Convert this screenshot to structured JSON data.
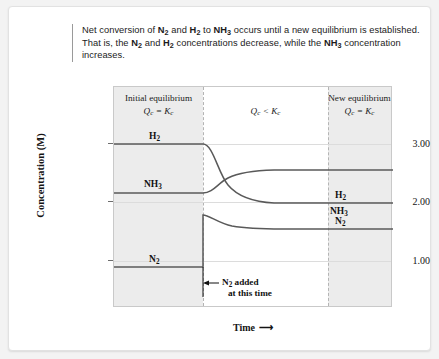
{
  "caption": {
    "segments": [
      {
        "t": "Net conversion of ",
        "b": false
      },
      {
        "t": "N2",
        "b": true
      },
      {
        "t": " and ",
        "b": false
      },
      {
        "t": "H2",
        "b": true
      },
      {
        "t": " to ",
        "b": false
      },
      {
        "t": "NH3",
        "b": true
      },
      {
        "t": " occurs until a new equilibrium is established. That is, the ",
        "b": false
      },
      {
        "t": "N2",
        "b": true
      },
      {
        "t": " and ",
        "b": false
      },
      {
        "t": "H2",
        "b": true
      },
      {
        "t": " concentrations decrease, while the ",
        "b": false
      },
      {
        "t": "NH3",
        "b": true
      },
      {
        "t": " concentration increases.",
        "b": false
      }
    ]
  },
  "axes": {
    "ylabel": "Concentration (M)",
    "xlabel": "Time",
    "xlabel_arrow": "⟶",
    "yticks": [
      "3.00",
      "2.00",
      "1.00"
    ]
  },
  "regions": [
    {
      "title": "Initial equilibrium",
      "expr_left": "Q",
      "expr_sub": "c",
      "expr_op": " = ",
      "expr_right": "K",
      "expr_sub2": "c"
    },
    {
      "title": "",
      "expr_left": "Q",
      "expr_sub": "c",
      "expr_op": " < ",
      "expr_right": "K",
      "expr_sub2": "c"
    },
    {
      "title": "New equilibrium",
      "expr_left": "Q",
      "expr_sub": "c",
      "expr_op": " = ",
      "expr_right": "K",
      "expr_sub2": "c"
    }
  ],
  "series_labels": {
    "h2_left": "H2",
    "nh3_left": "NH3",
    "n2_left": "N2",
    "h2_right": "H2",
    "nh3_right": "NH3",
    "n2_right": "N2"
  },
  "annotation": {
    "line1": "N2 added",
    "line2": "at this time"
  },
  "colors": {
    "curve": "#595959",
    "band": "#ececec",
    "plot_border": "#c9c9c9",
    "grid": "#dcdcdc",
    "card": "#ffffff",
    "text": "#1b1b1b"
  },
  "chart_data": {
    "type": "line",
    "title": "",
    "xlabel": "Time",
    "ylabel": "Concentration (M)",
    "ylim": [
      0.0,
      3.55
    ],
    "yticks": [
      1.0,
      2.0,
      3.0
    ],
    "grid": true,
    "legend": "inline-labels",
    "xlim": [
      0,
      100
    ],
    "event": {
      "name": "N2 added",
      "x": 32,
      "note": "at this time"
    },
    "regions": [
      {
        "label": "Initial equilibrium",
        "expr": "Qc = Kc",
        "x_range": [
          0,
          32
        ],
        "shaded": true
      },
      {
        "label": "",
        "expr": "Qc < Kc",
        "x_range": [
          32,
          77
        ],
        "shaded": false
      },
      {
        "label": "New equilibrium",
        "expr": "Qc = Kc",
        "x_range": [
          77,
          100
        ],
        "shaded": true
      }
    ],
    "series": [
      {
        "name": "H2",
        "initial_value": 3.0,
        "final_value": 2.45,
        "x": [
          0,
          32,
          38,
          45,
          55,
          65,
          77,
          100
        ],
        "values": [
          3.0,
          3.0,
          2.72,
          2.57,
          2.49,
          2.46,
          2.45,
          2.45
        ]
      },
      {
        "name": "NH3",
        "initial_value": 2.15,
        "final_value": 2.33,
        "x": [
          0,
          32,
          38,
          45,
          55,
          65,
          77,
          100
        ],
        "values": [
          2.15,
          2.15,
          2.22,
          2.29,
          2.32,
          2.33,
          2.33,
          2.33
        ]
      },
      {
        "name": "N2",
        "initial_value": 0.7,
        "spike_value": 1.6,
        "final_value": 1.4,
        "x": [
          0,
          32,
          32,
          38,
          45,
          55,
          65,
          77,
          100
        ],
        "values": [
          0.7,
          0.7,
          1.6,
          1.47,
          1.42,
          1.4,
          1.4,
          1.4,
          1.4
        ]
      }
    ]
  }
}
